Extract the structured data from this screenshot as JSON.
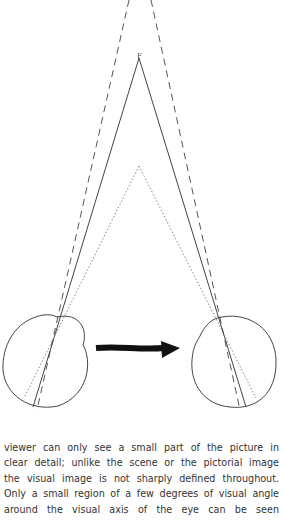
{
  "figure": {
    "label_F": "F"
  },
  "text": {
    "lines": [
      "viewer can only see a small part of the picture in",
      "clear detail; unlike the scene or the pictorial image",
      "the visual image is not sharply defined throughout.",
      "Only a small region of a few degrees of visual angle",
      "around the visual axis of the eye can be seen"
    ]
  }
}
